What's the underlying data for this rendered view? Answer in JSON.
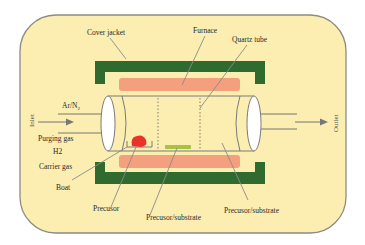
{
  "diagram": {
    "colors": {
      "background": "#fbeeb0",
      "border": "#8c8c84",
      "cover_jacket": "#2f6b2f",
      "furnace": "#f4a07e",
      "boat_precursor": "#e8322a",
      "substrate": "#a9c23f",
      "tube_outline": "#7a7a7a",
      "tube_end": "#ffffff",
      "arrow": "#777777"
    },
    "labels": {
      "cover_jacket": "Cover jacket",
      "furnace": "Furnace",
      "quartz_tube": "Quartz tube",
      "inlet": "Inlet",
      "outlet": "Outlet",
      "ar_n2": "Ar/N",
      "ar_n2_sub": "2",
      "purging_gas": "Purging gas",
      "h2": "H2",
      "carrier_gas": "Carrier gas",
      "boat": "Boat",
      "precursor": "Precusor",
      "precursor_substrate_1": "Precusor/substrate",
      "precursor_substrate_2": "Precusor/substrate"
    }
  }
}
